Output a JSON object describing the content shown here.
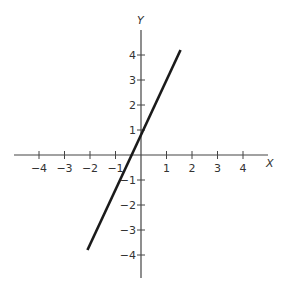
{
  "chart_data": {
    "type": "line",
    "title": "",
    "xlabel": "X",
    "ylabel": "Y",
    "xlim": [
      -5,
      5
    ],
    "ylim": [
      -5,
      5
    ],
    "grid": false,
    "legend": null,
    "x_ticks": [
      -4,
      -3,
      -2,
      -1,
      1,
      2,
      3,
      4
    ],
    "y_ticks": [
      4,
      3,
      2,
      1,
      -1,
      -2,
      -3,
      -4
    ],
    "x_tick_labels": [
      "−4",
      "−3",
      "−2",
      "−1",
      "1",
      "2",
      "3",
      "4"
    ],
    "y_tick_labels": [
      "4",
      "3",
      "2",
      "1",
      "−1",
      "−2",
      "−3",
      "−4"
    ],
    "series": [
      {
        "name": "y = 2x + 1",
        "x": [
          -2.1,
          1.55
        ],
        "y": [
          -3.8,
          4.2
        ],
        "color": "#1a1a1a"
      }
    ]
  },
  "labels": {
    "x_axis": "X",
    "y_axis": "Y"
  },
  "colors": {
    "axis": "#444444",
    "line": "#1a1a1a",
    "text": "#333333"
  }
}
